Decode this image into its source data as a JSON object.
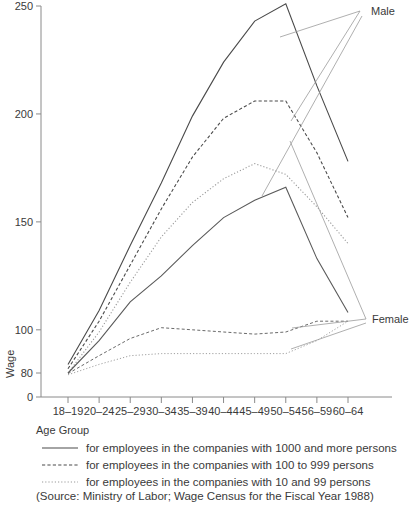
{
  "chart_data": {
    "type": "line",
    "title": "",
    "xlabel": "Age Group",
    "ylabel": "Wage",
    "categories": [
      "18–19",
      "20–24",
      "25–29",
      "30–34",
      "35–39",
      "40–44",
      "45–49",
      "50–54",
      "56–59",
      "60–64"
    ],
    "ytick_labels": [
      "0",
      "80",
      "100",
      "150",
      "200",
      "250"
    ],
    "ytick_values": [
      0,
      80,
      100,
      150,
      200,
      250
    ],
    "ylim": [
      0,
      250
    ],
    "axis_break_note": "compressed between 0 and 80",
    "grid": false,
    "legend_position": "below-axis",
    "group_labels": {
      "male": "Male",
      "female": "Female"
    },
    "series": [
      {
        "name": "Male, companies with 1000 and more persons",
        "group": "Male",
        "style": "solid",
        "values": [
          84,
          109,
          139,
          168,
          199,
          224,
          243,
          251,
          213,
          178
        ]
      },
      {
        "name": "Male, companies with 100 to 999 persons",
        "group": "Male",
        "style": "dashed",
        "values": [
          82,
          104,
          130,
          156,
          180,
          198,
          206,
          206,
          182,
          152
        ]
      },
      {
        "name": "Male, companies with 10 and 99 persons",
        "group": "Male",
        "style": "dotted",
        "values": [
          80,
          99,
          122,
          143,
          159,
          170,
          177,
          172,
          157,
          140
        ]
      },
      {
        "name": "Female, companies with 1000 and more persons",
        "group": "Female",
        "style": "solid",
        "values": [
          80,
          95,
          113,
          125,
          139,
          152,
          160,
          166,
          133,
          108
        ]
      },
      {
        "name": "Female, companies with 100 to 999 persons",
        "group": "Female",
        "style": "dashed",
        "values": [
          78,
          88,
          96,
          101,
          100,
          99,
          98,
          99,
          104,
          104
        ]
      },
      {
        "name": "Female, companies with 10 and 99 persons",
        "group": "Female",
        "style": "dotted",
        "values": [
          74,
          84,
          88,
          89,
          89,
          89,
          89,
          89,
          95,
          104
        ]
      }
    ]
  },
  "legend": {
    "entries": [
      {
        "style": "solid",
        "label": "for employees in the companies with 1000 and more persons"
      },
      {
        "style": "dashed",
        "label": "for employees in the companies with 100 to 999 persons"
      },
      {
        "style": "dotted",
        "label": "for employees in the companies with 10 and 99 persons"
      }
    ]
  },
  "source": "(Source: Ministry of Labor; Wage Census for the Fiscal Year 1988)"
}
